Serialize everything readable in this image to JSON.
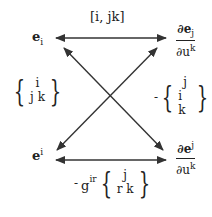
{
  "diagram": {
    "top_edge_label": "[i, jk]",
    "nodes": {
      "top_left": {
        "base": "e",
        "sub": "i"
      },
      "bottom_left": {
        "base": "e",
        "sup": "i"
      },
      "top_right": {
        "num_base": "∂e",
        "num_sub": "j",
        "den_base": "∂u",
        "den_sup": "k"
      },
      "bottom_right": {
        "num_base": "∂e",
        "num_sup": "j",
        "den_base": "∂u",
        "den_sup": "k"
      }
    },
    "left_label": {
      "top": "i",
      "bottom": "j k",
      "open": "{",
      "close": "}"
    },
    "right_label": {
      "sign": "-",
      "top": "j",
      "bottom": "i k",
      "open": "{",
      "close": "}"
    },
    "bottom_label": {
      "sign": "-",
      "base": "g",
      "sup": "ir",
      "top": "j",
      "bottom": "r k",
      "open": "{",
      "close": "}"
    },
    "line_color": "#333333"
  }
}
